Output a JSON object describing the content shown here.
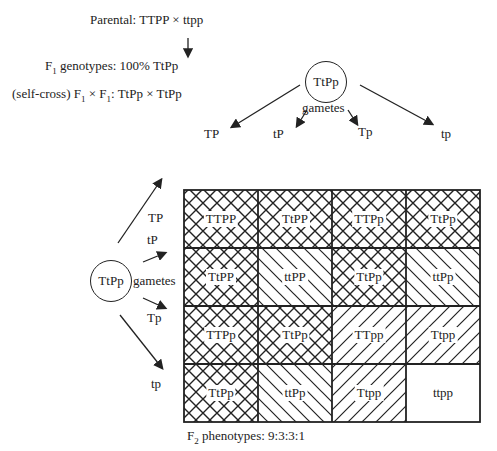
{
  "header": {
    "parental": "Parental: TTPP × ttpp",
    "f1_prefix": "F",
    "f1_sub": "1",
    "f1_text": " genotypes: 100% TtPp",
    "selfcross_a": "(self-cross) F",
    "selfcross_sub1": "1",
    "selfcross_b": " × F",
    "selfcross_sub2": "1",
    "selfcross_c": ": TtPp × TtPp"
  },
  "top_parent": {
    "genotype": "TtPp",
    "gametes_label": "gametes"
  },
  "left_parent": {
    "genotype": "TtPp",
    "gametes_label": "gametes"
  },
  "top_gametes": [
    "TP",
    "tP",
    "Tp",
    "tp"
  ],
  "left_gametes": [
    "TP",
    "tP",
    "Tp",
    "tp"
  ],
  "grid": [
    [
      {
        "g": "TTPP",
        "p": "cross"
      },
      {
        "g": "TtPP",
        "p": "cross"
      },
      {
        "g": "TTPp",
        "p": "cross"
      },
      {
        "g": "TtPp",
        "p": "cross"
      }
    ],
    [
      {
        "g": "TtPP",
        "p": "cross"
      },
      {
        "g": "ttPP",
        "p": "back"
      },
      {
        "g": "TtPp",
        "p": "cross"
      },
      {
        "g": "ttPp",
        "p": "back"
      }
    ],
    [
      {
        "g": "TTPp",
        "p": "cross"
      },
      {
        "g": "TtPp",
        "p": "cross"
      },
      {
        "g": "TTpp",
        "p": "fwd"
      },
      {
        "g": "Ttpp",
        "p": "fwd"
      }
    ],
    [
      {
        "g": "TtPp",
        "p": "cross"
      },
      {
        "g": "ttPp",
        "p": "back"
      },
      {
        "g": "Ttpp",
        "p": "fwd"
      },
      {
        "g": "ttpp",
        "p": "none"
      }
    ]
  ],
  "footer": {
    "prefix": "F",
    "sub": "2",
    "text": " phenotypes: 9:3:3:1"
  }
}
